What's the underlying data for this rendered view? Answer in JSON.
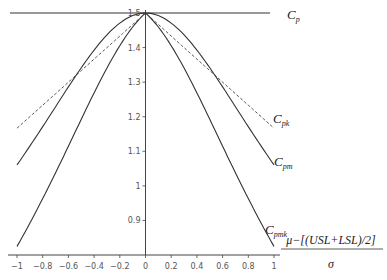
{
  "chart_data": {
    "type": "line",
    "title": "",
    "xlabel": "μ−[(USL+LSL)/2] / σ",
    "xlabel_numerator": "μ−[(USL+LSL)/2]",
    "xlabel_denominator": "σ",
    "ylabel": "",
    "xlim": [
      -1,
      1
    ],
    "ylim": [
      0.8,
      1.5
    ],
    "grid": false,
    "legend_position": "right (inline curve labels)",
    "x_ticks": [
      "−1",
      "−0.8",
      "−0.6",
      "−0.4",
      "−0.2",
      "0",
      "0.2",
      "0.4",
      "0.6",
      "0.8",
      "1"
    ],
    "y_ticks": [
      "0.9",
      "1",
      "1.1",
      "1.2",
      "1.3",
      "1.4",
      "1.5"
    ],
    "x": [
      -1,
      -0.8,
      -0.6,
      -0.4,
      -0.2,
      0,
      0.2,
      0.4,
      0.6,
      0.8,
      1
    ],
    "series": [
      {
        "name": "Cp",
        "label_main": "C",
        "label_sub": "p",
        "style": "solid",
        "values": [
          1.5,
          1.5,
          1.5,
          1.5,
          1.5,
          1.5,
          1.5,
          1.5,
          1.5,
          1.5,
          1.5
        ]
      },
      {
        "name": "Cpk",
        "label_main": "C",
        "label_sub": "pk",
        "style": "dashed",
        "values": [
          1.167,
          1.233,
          1.3,
          1.367,
          1.433,
          1.5,
          1.433,
          1.367,
          1.3,
          1.233,
          1.167
        ]
      },
      {
        "name": "Cpm",
        "label_main": "C",
        "label_sub": "pm",
        "style": "solid",
        "values": [
          1.061,
          1.171,
          1.393,
          1.393,
          1.471,
          1.5,
          1.471,
          1.393,
          1.286,
          1.171,
          1.061
        ]
      },
      {
        "name": "Cpmk",
        "label_main": "C",
        "label_sub": "pmk",
        "style": "solid",
        "values": [
          0.825,
          0.963,
          1.115,
          1.269,
          1.405,
          1.5,
          1.405,
          1.269,
          1.115,
          0.963,
          0.825
        ]
      }
    ]
  }
}
